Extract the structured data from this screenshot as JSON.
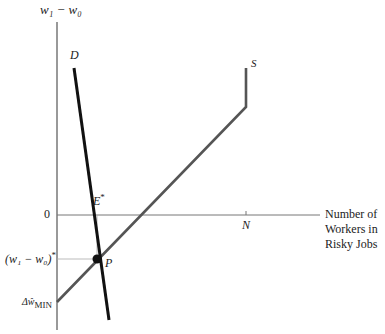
{
  "diagram": {
    "y_axis_label": "w₁ − w₀",
    "x_axis_label_lines": [
      "Number of",
      "Workers in",
      "Risky Jobs"
    ],
    "zero_label": "0",
    "n_label": "N",
    "supply_label": "S",
    "demand_label": "D",
    "equilibrium_e_label": "E",
    "equilibrium_e_sup": "*",
    "point_p_label": "P",
    "wage_star_label": "(w₁ − w₀)",
    "wage_star_sup": "*",
    "min_label_prefix": "Δŵ",
    "min_label_sub": "MIN"
  },
  "colors": {
    "axis": "#555555",
    "supply": "#555555",
    "demand": "#111111",
    "guide": "#999999"
  }
}
